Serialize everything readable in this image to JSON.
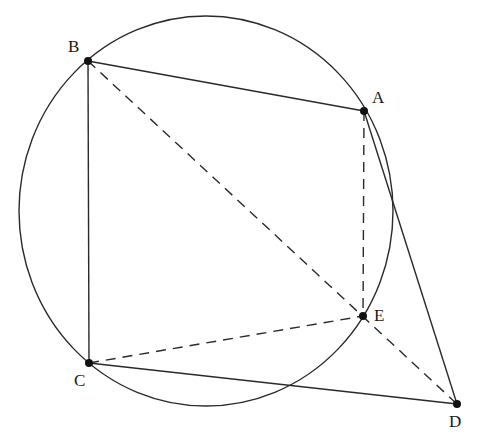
{
  "diagram": {
    "type": "geometry",
    "circle": {
      "cx": 206,
      "cy": 211,
      "rx": 187,
      "ry": 195,
      "stroke": "#2a2a2a"
    },
    "points": [
      {
        "name": "A",
        "x": 364,
        "y": 111,
        "label_x": 372,
        "label_y": 89
      },
      {
        "name": "B",
        "x": 88,
        "y": 61,
        "label_x": 68,
        "label_y": 38
      },
      {
        "name": "C",
        "x": 89,
        "y": 363,
        "label_x": 74,
        "label_y": 372
      },
      {
        "name": "D",
        "x": 457,
        "y": 404,
        "label_x": 449,
        "label_y": 413
      },
      {
        "name": "E",
        "x": 363,
        "y": 316,
        "label_x": 374,
        "label_y": 307
      }
    ],
    "segments": [
      {
        "from": "B",
        "to": "A",
        "style": "solid"
      },
      {
        "from": "B",
        "to": "C",
        "style": "solid"
      },
      {
        "from": "C",
        "to": "D",
        "style": "solid"
      },
      {
        "from": "A",
        "to": "D",
        "style": "solid"
      },
      {
        "from": "A",
        "to": "E",
        "style": "dashed"
      },
      {
        "from": "C",
        "to": "E",
        "style": "dashed"
      },
      {
        "from": "B",
        "to": "D",
        "style": "dashed"
      }
    ],
    "labels": {
      "A": "A",
      "B": "B",
      "C": "C",
      "D": "D",
      "E": "E"
    }
  }
}
